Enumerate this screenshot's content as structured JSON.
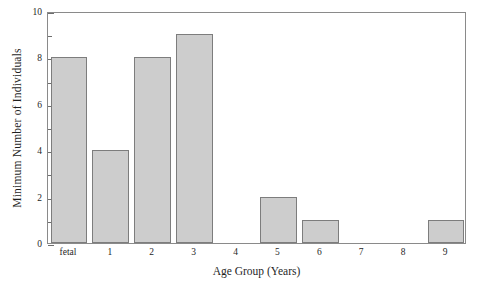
{
  "chart_data": {
    "type": "bar",
    "title": "",
    "subtitle": "",
    "xlabel": "Age Group (Years)",
    "ylabel": "Minimum Number of Individuals",
    "categories": [
      "fetal",
      "1",
      "2",
      "3",
      "4",
      "5",
      "6",
      "7",
      "8",
      "9"
    ],
    "values": [
      8,
      4,
      8,
      9,
      0,
      2,
      1,
      0,
      0,
      1
    ],
    "series": [
      {
        "name": "Minimum Number of Individuals",
        "values": [
          8,
          4,
          8,
          9,
          0,
          2,
          1,
          0,
          0,
          1
        ]
      }
    ],
    "ylim": [
      0,
      10
    ],
    "xlim_categories": 10,
    "y_major_ticks": [
      0,
      2,
      4,
      6,
      8,
      10
    ],
    "y_major_tick_labels": [
      "0",
      "2",
      "4",
      "6",
      "8",
      "10"
    ],
    "y_minor_ticks": [
      1,
      3,
      5,
      7,
      9
    ],
    "x_tick_labels": [
      "fetal",
      "1",
      "2",
      "3",
      "4",
      "5",
      "6",
      "7",
      "8",
      "9"
    ],
    "grid": false,
    "legend": null,
    "legend_position": "none",
    "annotations": [],
    "colors": {
      "bar_fill": "#cdcdcd",
      "bar_edge": "#7d7d7d",
      "frame": "#8a8a8a",
      "tick": "#6e6e6e",
      "text": "#1f1f1f",
      "background": "#ffffff"
    }
  }
}
